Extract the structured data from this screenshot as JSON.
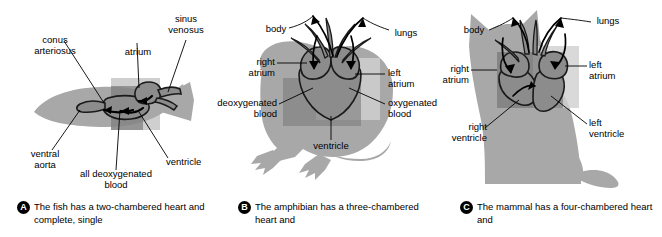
{
  "figure": {
    "colors": {
      "body_silhouette": "#a8a8a8",
      "heart_dark": "#6e6e6e",
      "heart_mid": "#8c8c8c",
      "highlight_box": "#cfcfcf",
      "highlight_box_dark": "#7d7d7d",
      "outline": "#1a1a1a",
      "text": "#000000",
      "background": "#ffffff"
    }
  },
  "panels": [
    {
      "id": "A",
      "animal": "fish",
      "badge": "A",
      "caption": "The fish has a two-chambered heart and complete, single",
      "labels": [
        {
          "name": "conus-arteriosus",
          "text": "conus\narteriosus"
        },
        {
          "name": "atrium",
          "text": "atrium"
        },
        {
          "name": "sinus-venosus",
          "text": "sinus\nvenosus"
        },
        {
          "name": "ventral-aorta",
          "text": "ventral\naorta"
        },
        {
          "name": "all-deoxygenated-blood",
          "text": "all deoxygenated\nblood"
        },
        {
          "name": "ventricle",
          "text": "ventricle"
        }
      ],
      "label_text": {
        "conus_arteriosus_l1": "conus",
        "conus_arteriosus_l2": "arteriosus",
        "atrium": "atrium",
        "sinus_venosus_l1": "sinus",
        "sinus_venosus_l2": "venosus",
        "ventral_aorta_l1": "ventral",
        "ventral_aorta_l2": "aorta",
        "all_deox_l1": "all deoxygenated",
        "all_deox_l2": "blood",
        "ventricle": "ventricle"
      }
    },
    {
      "id": "B",
      "animal": "amphibian",
      "badge": "B",
      "caption": "The amphibian has a three-chambered heart and",
      "labels": [
        {
          "name": "body",
          "text": "body"
        },
        {
          "name": "lungs",
          "text": "lungs"
        },
        {
          "name": "right-atrium",
          "text": "right\natrium"
        },
        {
          "name": "left-atrium",
          "text": "left\natrium"
        },
        {
          "name": "deoxygenated-blood",
          "text": "deoxygenated\nblood"
        },
        {
          "name": "oxygenated-blood",
          "text": "oxygenated\nblood"
        },
        {
          "name": "ventricle",
          "text": "ventricle"
        }
      ],
      "label_text": {
        "body": "body",
        "lungs": "lungs",
        "right_atrium_l1": "right",
        "right_atrium_l2": "atrium",
        "left_atrium_l1": "left",
        "left_atrium_l2": "atrium",
        "deox_l1": "deoxygenated",
        "deox_l2": "blood",
        "ox_l1": "oxygenated",
        "ox_l2": "blood",
        "ventricle": "ventricle"
      }
    },
    {
      "id": "C",
      "animal": "mammal",
      "badge": "C",
      "caption": "The mammal has a four-chambered heart and",
      "labels": [
        {
          "name": "body",
          "text": "body"
        },
        {
          "name": "lungs",
          "text": "lungs"
        },
        {
          "name": "right-atrium",
          "text": "right\natrium"
        },
        {
          "name": "left-atrium",
          "text": "left\natrium"
        },
        {
          "name": "right-ventricle",
          "text": "right\nventricle"
        },
        {
          "name": "left-ventricle",
          "text": "left\nventricle"
        }
      ],
      "label_text": {
        "body": "body",
        "lungs": "lungs",
        "right_atrium_l1": "right",
        "right_atrium_l2": "atrium",
        "left_atrium_l1": "left",
        "left_atrium_l2": "atrium",
        "right_ventricle_l1": "right",
        "right_ventricle_l2": "ventricle",
        "left_ventricle_l1": "left",
        "left_ventricle_l2": "ventricle"
      }
    }
  ]
}
